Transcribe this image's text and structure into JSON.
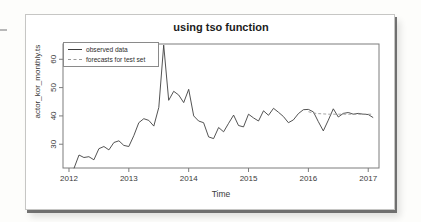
{
  "chart_data": {
    "type": "line",
    "title": "using tso function",
    "xlabel": "Time",
    "ylabel": "actor_kor_monthly.ts",
    "x_ticks": [
      2012,
      2013,
      2014,
      2015,
      2016,
      2017
    ],
    "y_ticks": [
      30,
      40,
      50,
      60
    ],
    "xlim": [
      2011.9,
      2017.18
    ],
    "ylim": [
      21.6,
      65.4
    ],
    "grid": false,
    "legend_position": "top-left",
    "series": [
      {
        "name": "observed data",
        "style": "solid",
        "color": "#3f3f3f",
        "start": 2012.0833,
        "step": 0.08333,
        "values": [
          21.5,
          26.2,
          25.3,
          25.6,
          24.5,
          28.4,
          29.2,
          28.0,
          30.6,
          31.2,
          29.6,
          29.2,
          33.0,
          37.6,
          39.0,
          38.4,
          36.4,
          43.0,
          65.0,
          45.5,
          48.7,
          47.4,
          44.7,
          49.4,
          40.0,
          38.2,
          37.6,
          32.6,
          32.0,
          35.9,
          34.4,
          37.4,
          40.3,
          36.6,
          36.1,
          40.6,
          39.3,
          38.2,
          41.8,
          40.2,
          42.7,
          41.3,
          39.8,
          37.6,
          38.6,
          40.8,
          42.2,
          42.3,
          41.4,
          38.0,
          34.7,
          38.5,
          42.5,
          39.6,
          40.9,
          41.2,
          40.6,
          40.9,
          40.6,
          40.5,
          39.4
        ]
      },
      {
        "name": "forecasts for test set",
        "style": "dashed",
        "color": "#9a9a9a",
        "start": 2016.0,
        "step": 0.08333,
        "values": [
          41.5,
          41.0,
          40.8,
          40.7,
          40.6,
          40.6,
          40.6,
          40.6,
          40.6,
          40.6,
          40.6,
          40.6,
          40.6,
          40.6
        ]
      }
    ]
  }
}
